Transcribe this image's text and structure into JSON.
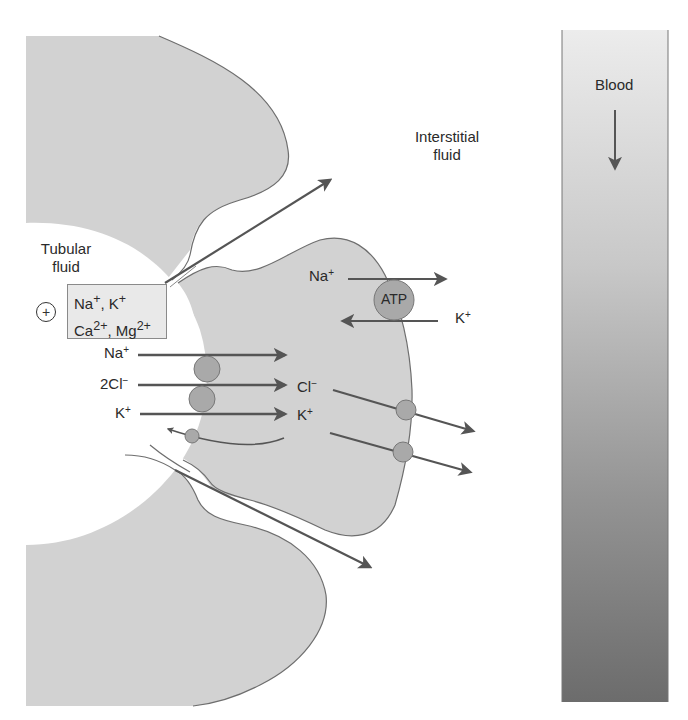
{
  "diagram": {
    "regions": {
      "tubular_fluid": "Tubular fluid",
      "tubular_fluid_line1": "Tubular",
      "tubular_fluid_line2": "fluid",
      "interstitial_fluid_line1": "Interstitial",
      "interstitial_fluid_line2": "fluid",
      "blood": "Blood"
    },
    "lumen_charge": "+",
    "paracellular_box": {
      "line1": {
        "a": "Na",
        "a_sup": "+",
        "sep": ", ",
        "b": "K",
        "b_sup": "+"
      },
      "line2": {
        "a": "Ca",
        "a_sup": "2+",
        "sep": ", ",
        "b": "Mg",
        "b_sup": "2+"
      }
    },
    "cotransporter": {
      "ions": [
        {
          "base": "Na",
          "sup": "+"
        },
        {
          "base": "2Cl",
          "sup": "−"
        },
        {
          "base": "K",
          "sup": "+"
        }
      ]
    },
    "intracellular_labels": [
      {
        "base": "Cl",
        "sup": "−"
      },
      {
        "base": "K",
        "sup": "+"
      }
    ],
    "pump": {
      "label": "ATP",
      "out_ion": {
        "base": "Na",
        "sup": "+"
      },
      "in_ion": {
        "base": "K",
        "sup": "+"
      }
    },
    "colors": {
      "cell_fill": "#d2d2d2",
      "outline": "#6e6e6e",
      "arrow": "#555555",
      "channel_fill": "#a9a9a9",
      "blood_top": "#e6e6e6",
      "blood_bottom": "#6f6f6f"
    }
  }
}
